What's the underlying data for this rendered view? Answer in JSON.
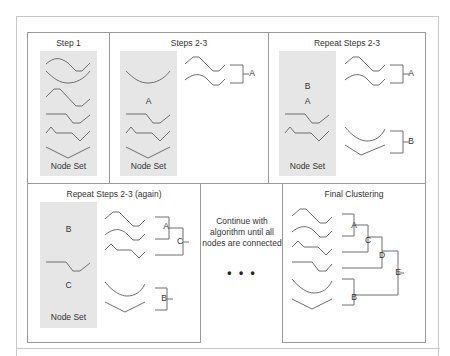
{
  "diagram": {
    "step1": {
      "title": "Step 1",
      "node_set_label": "Node Set"
    },
    "steps23": {
      "title": "Steps 2-3",
      "node_set_label": "Node Set",
      "panel_labels": [
        "A"
      ],
      "cluster_labels": [
        "A"
      ]
    },
    "repeat23": {
      "title": "Repeat Steps 2-3",
      "node_set_label": "Node Set",
      "panel_labels": [
        "B",
        "A"
      ],
      "cluster_labels": [
        "A",
        "B"
      ]
    },
    "repeat23_again": {
      "title": "Repeat Steps 2-3 (again)",
      "node_set_label": "Node Set",
      "panel_labels": [
        "B",
        "C"
      ],
      "cluster_labels": [
        "A",
        "C",
        "B"
      ]
    },
    "continue": {
      "line1": "Continue with",
      "line2": "algorithm until all",
      "line3": "nodes are connected",
      "ellipsis": "• • •"
    },
    "final": {
      "title": "Final Clustering",
      "cluster_labels": [
        "A",
        "C",
        "D",
        "E",
        "B"
      ]
    },
    "colors": {
      "line": "#6f6f6f",
      "panel": "#e6e6e6",
      "border": "#9a9a9a"
    }
  }
}
